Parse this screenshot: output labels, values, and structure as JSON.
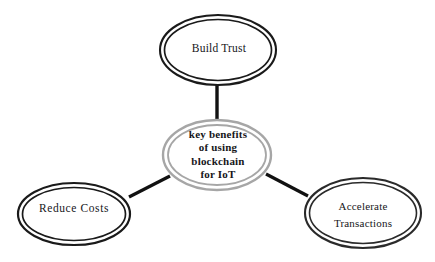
{
  "diagram": {
    "type": "hub-and-spoke-concept-map",
    "background_color": "#ffffff",
    "outer_node_border_color": "#1a1a1a",
    "center_node_border_color": "#a6a6a6",
    "connector_color": "#111111",
    "text_color": "#16161a",
    "center_node": {
      "id": "key-benefits",
      "label": "key benefits of using blockchain for IoT",
      "lines": [
        "key benefits",
        "of using",
        "blockchain",
        "for IoT"
      ],
      "line1": "key benefits",
      "line2": "of using",
      "line3": "blockchain",
      "line4": "for IoT",
      "shape": "double-ellipse",
      "border_color": "#a6a6a6",
      "cx": 217,
      "cy": 155,
      "rx": 54,
      "ry": 35
    },
    "outer_nodes": [
      {
        "id": "build-trust",
        "label": "Build Trust",
        "lines": [
          "Build Trust"
        ],
        "line1": "Build Trust",
        "line2": "",
        "shape": "double-ellipse",
        "border_color": "#1a1a1a",
        "position": "top",
        "cx": 218,
        "cy": 50,
        "rx": 58,
        "ry": 35
      },
      {
        "id": "reduce-costs",
        "label": "Reduce Costs",
        "lines": [
          "Reduce Costs"
        ],
        "line1": "Reduce Costs",
        "line2": "",
        "shape": "double-ellipse",
        "border_color": "#1a1a1a",
        "position": "bottom-left",
        "cx": 74,
        "cy": 214,
        "rx": 56,
        "ry": 31
      },
      {
        "id": "accelerate-transactions",
        "label": "Accelerate Transactions",
        "lines": [
          "Accelerate",
          "Transactions"
        ],
        "line1": "Accelerate",
        "line2": "Transactions",
        "shape": "double-ellipse",
        "border_color": "#1a1a1a",
        "position": "bottom-right",
        "cx": 363,
        "cy": 213,
        "rx": 58,
        "ry": 35
      }
    ],
    "connectors": [
      {
        "id": "connector-center-build-trust",
        "from": "key-benefits",
        "to": "build-trust",
        "x1": 217,
        "y1": 122,
        "x2": 217,
        "y2": 85
      },
      {
        "id": "connector-center-reduce-costs",
        "from": "key-benefits",
        "to": "reduce-costs",
        "x1": 170,
        "y1": 176,
        "x2": 129,
        "y2": 197
      },
      {
        "id": "connector-center-accelerate-transactions",
        "from": "key-benefits",
        "to": "accelerate-transactions",
        "x1": 266,
        "y1": 174,
        "x2": 308,
        "y2": 196
      }
    ]
  }
}
